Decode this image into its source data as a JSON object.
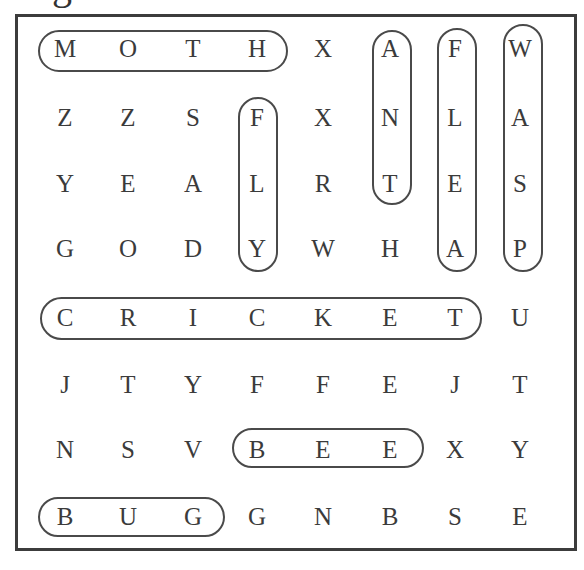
{
  "title_fragment": "g",
  "grid": {
    "rows": [
      [
        "M",
        "O",
        "T",
        "H",
        "X",
        "A",
        "F",
        "W"
      ],
      [
        "Z",
        "Z",
        "S",
        "F",
        "X",
        "N",
        "L",
        "A"
      ],
      [
        "Y",
        "E",
        "A",
        "L",
        "R",
        "T",
        "E",
        "S"
      ],
      [
        "G",
        "O",
        "D",
        "Y",
        "W",
        "H",
        "A",
        "P"
      ],
      [
        "C",
        "R",
        "I",
        "C",
        "K",
        "E",
        "T",
        "U"
      ],
      [
        "J",
        "T",
        "Y",
        "F",
        "F",
        "E",
        "J",
        "T"
      ],
      [
        "N",
        "S",
        "V",
        "B",
        "E",
        "E",
        "X",
        "Y"
      ],
      [
        "B",
        "U",
        "G",
        "G",
        "N",
        "B",
        "S",
        "E"
      ]
    ],
    "col_x": [
      65,
      128,
      193,
      257,
      323,
      390,
      455,
      520
    ],
    "row_y": [
      49,
      118,
      184,
      249,
      318,
      385,
      450,
      517
    ]
  },
  "found_words": [
    {
      "word": "MOTH",
      "direction": "horizontal",
      "row": 0,
      "start_col": 0,
      "end_col": 3,
      "box": [
        38,
        30,
        250,
        42
      ]
    },
    {
      "word": "ANT",
      "direction": "vertical",
      "col": 5,
      "start_row": 0,
      "end_row": 2,
      "box": [
        372,
        30,
        40,
        175
      ]
    },
    {
      "word": "FLEA",
      "direction": "vertical",
      "col": 6,
      "start_row": 0,
      "end_row": 3,
      "box": [
        437,
        28,
        40,
        244
      ]
    },
    {
      "word": "WASP",
      "direction": "vertical",
      "col": 7,
      "start_row": 0,
      "end_row": 3,
      "box": [
        503,
        24,
        40,
        248
      ]
    },
    {
      "word": "FLY",
      "direction": "vertical",
      "col": 3,
      "start_row": 1,
      "end_row": 3,
      "box": [
        238,
        97,
        40,
        175
      ]
    },
    {
      "word": "CRICKET",
      "direction": "horizontal",
      "row": 4,
      "start_col": 0,
      "end_col": 6,
      "box": [
        40,
        297,
        442,
        43
      ]
    },
    {
      "word": "BEE",
      "direction": "horizontal",
      "row": 6,
      "start_col": 3,
      "end_col": 5,
      "box": [
        232,
        428,
        192,
        40
      ]
    },
    {
      "word": "BUG",
      "direction": "horizontal",
      "row": 7,
      "start_col": 0,
      "end_col": 2,
      "box": [
        38,
        497,
        187,
        40
      ]
    }
  ]
}
